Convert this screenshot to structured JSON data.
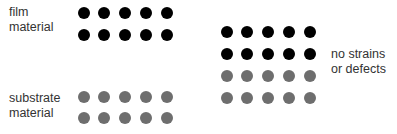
{
  "labels": {
    "film": [
      "film",
      "material"
    ],
    "substrate": [
      "substrate",
      "material"
    ],
    "result": [
      "no strains",
      "or defects"
    ]
  },
  "colors": {
    "film_atom": "#000000",
    "substrate_atom": "#6e6e6e",
    "text": "#333333",
    "background": "#ffffff"
  },
  "groups": {
    "film_left": {
      "type": "film",
      "x": [
        84,
        104,
        125,
        146,
        167
      ],
      "y": [
        13,
        35
      ]
    },
    "substrate_left": {
      "type": "sub",
      "x": [
        84,
        104,
        125,
        146,
        167
      ],
      "y": [
        97,
        118
      ]
    },
    "combined_right_film": {
      "type": "film",
      "x": [
        227,
        247,
        268,
        289,
        310
      ],
      "y": [
        32,
        54
      ]
    },
    "combined_right_substrate": {
      "type": "sub",
      "x": [
        227,
        247,
        268,
        289,
        310
      ],
      "y": [
        76,
        98
      ]
    }
  }
}
